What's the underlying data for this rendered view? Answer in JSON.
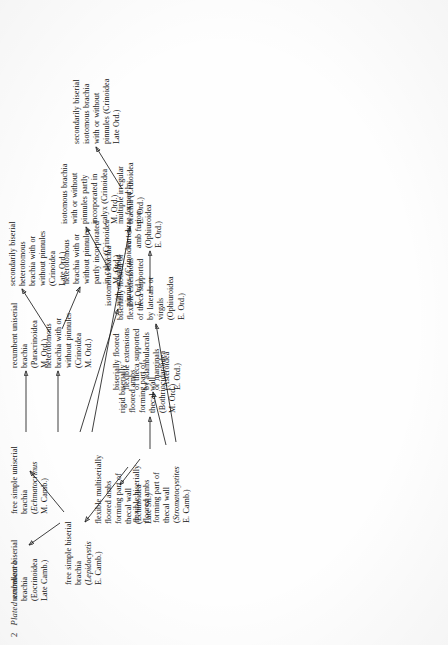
{
  "page": {
    "folio": "2",
    "running_head": "Plated ambulacra"
  },
  "diagram": {
    "type": "evolutionary-flow-chart",
    "orientation": "rotated-90-ccw",
    "nodes": [
      {
        "id": "root",
        "name": "flexible-biserially-floored-ambs",
        "lines": [
          "flexible biserially",
          "floored ambs",
          "forming part of",
          "thecal wall"
        ],
        "taxon": "Stromatocystites",
        "taxon_italic": true,
        "age": "E. Camb.)",
        "taxon_prefix": "("
      },
      {
        "id": "free-simple-biserial",
        "name": "free-simple-biserial-brachia",
        "lines": [
          "free simple biserial",
          "brachia"
        ],
        "taxon": "Lepidocystis",
        "taxon_italic": true,
        "age": "E. Camb.)",
        "taxon_prefix": "("
      },
      {
        "id": "flexible-multiserially",
        "name": "flexible-multiserially-floored-ambs",
        "lines": [
          "flexible multiserially",
          "floored ambs",
          "forming part of",
          "thecal wall",
          "(Echinoidea",
          "Late Sil.)"
        ]
      },
      {
        "id": "rigid-biserially",
        "name": "rigid-biserially-floored-ambs",
        "lines": [
          "rigid biserially",
          "floored ambs",
          "forming part of",
          "thecal wall",
          "(Bothriocidaroidea",
          "M. Ord.)"
        ]
      },
      {
        "id": "biserially-floored-asteroid",
        "name": "biserially-floored-flexible-extensions-asteroidea",
        "lines": [
          "biserially floored",
          "flexible extensions",
          "of theca supported",
          "by adambulacrals",
          "or marginals",
          "(Asteroidea",
          "E. Ord.)"
        ]
      },
      {
        "id": "biserially-floored-ophiuroid",
        "name": "biserially-floored-flexible-extensions-ophiuroidea",
        "lines": [
          "biserially floored or",
          "flexible extensions",
          "of theca supported",
          "by laterals or",
          "virgals",
          "(Ophiuroidea",
          "E. Ord.)"
        ]
      },
      {
        "id": "vertebrae",
        "name": "vertebrae-formed-by-amb-fusion",
        "lines": [
          "vertebrae formed by",
          "amb fusion",
          "(Ophiuroidea",
          "E. Ord.)"
        ]
      },
      {
        "id": "recumbent-biserial",
        "name": "recumbent-biserial-brachia",
        "lines": [
          "recumbent biserial",
          "brachia",
          "(Eocrinoidea",
          "Late Camb.)"
        ]
      },
      {
        "id": "free-simple-uniserial",
        "name": "free-simple-uniserial-brachia",
        "lines": [
          "free simple uniserial",
          "brachia"
        ],
        "taxon": "Echmatocrinus",
        "taxon_italic": true,
        "age": "M. Camb.)",
        "taxon_prefix": "("
      },
      {
        "id": "recumbent-uniserial",
        "name": "recumbent-uniserial-brachia",
        "lines": [
          "recumbent uniserial",
          "brachia",
          "(Paracrinoidea",
          "M. Ord.)"
        ]
      },
      {
        "id": "heterotomous-mord",
        "name": "heterotomous-brachia-crinoidea-m-ord",
        "lines": [
          "heterotomous",
          "brachia with or",
          "without pinnules",
          "(Crinoidea",
          "M. Ord.)"
        ]
      },
      {
        "id": "isotomous-eord",
        "name": "isotomous-brachia-crinoidea-e-ord",
        "lines": [
          "isotomous brachia",
          "with or without",
          "pinnules (Crinoidea",
          "E. Ord.)"
        ]
      },
      {
        "id": "multiple-irregular",
        "name": "multiple-irregular-brachia",
        "lines": [
          "multiple irregular",
          "brachia (Crinoidea",
          "E. Ord.)"
        ]
      },
      {
        "id": "secondarily-biserial-heterotomous",
        "name": "secondarily-biserial-heterotomous-brachia",
        "lines": [
          "secondarily biserial",
          "heterotomous",
          "brachia with or",
          "without pinnules",
          "(Crinoidea",
          "Late Ord.)"
        ]
      },
      {
        "id": "heterotomous-partly-incorporated",
        "name": "heterotomous-brachia-partly-incorporated",
        "lines": [
          "heterotomous",
          "brachia with or",
          "without pinnules",
          "partly incorporated",
          "in calyx (Crinoidea",
          "M. Ord.)"
        ]
      },
      {
        "id": "isotomous-partly-incorporated",
        "name": "isotomous-brachia-partly-incorporated",
        "lines": [
          "isotomous brachia",
          "with or without",
          "pinnules partly",
          "incorporated in",
          "calyx (Crinoidea",
          "M. Ord.)"
        ]
      },
      {
        "id": "secondarily-biserial-isotomous",
        "name": "secondarily-biserial-isotomous-brachia",
        "lines": [
          "secondarily biserial",
          "isotomous brachia",
          "with or without",
          "pinnules (Crinoidea",
          "Late Ord.)"
        ]
      }
    ],
    "edges": [
      {
        "from": "root",
        "to": "free-simple-biserial"
      },
      {
        "from": "root",
        "to": "flexible-multiserially"
      },
      {
        "from": "root",
        "to": "rigid-biserially"
      },
      {
        "from": "root",
        "to": "biserially-floored-asteroid"
      },
      {
        "from": "root",
        "to": "biserially-floored-ophiuroid"
      },
      {
        "from": "biserially-floored-ophiuroid",
        "to": "vertebrae"
      },
      {
        "from": "free-simple-biserial",
        "to": "recumbent-biserial"
      },
      {
        "from": "free-simple-biserial",
        "to": "free-simple-uniserial"
      },
      {
        "from": "free-simple-uniserial",
        "to": "recumbent-uniserial"
      },
      {
        "from": "free-simple-uniserial",
        "to": "heterotomous-mord"
      },
      {
        "from": "free-simple-uniserial",
        "to": "isotomous-eord"
      },
      {
        "from": "free-simple-uniserial",
        "to": "multiple-irregular"
      },
      {
        "from": "heterotomous-mord",
        "to": "secondarily-biserial-heterotomous"
      },
      {
        "from": "heterotomous-mord",
        "to": "heterotomous-partly-incorporated"
      },
      {
        "from": "isotomous-eord",
        "to": "isotomous-partly-incorporated"
      },
      {
        "from": "multiple-irregular",
        "to": "secondarily-biserial-isotomous"
      }
    ]
  }
}
